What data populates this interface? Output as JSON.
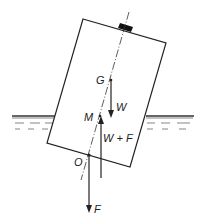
{
  "diagram": {
    "labels": {
      "G": "G",
      "W": "W",
      "M": "M",
      "WF": "W + F",
      "O": "O",
      "F": "F"
    },
    "points": {
      "G": [
        111,
        80
      ],
      "M": [
        100,
        116
      ],
      "O": [
        89,
        155
      ]
    },
    "forces": [
      {
        "name": "W",
        "from": "G",
        "direction": "down"
      },
      {
        "name": "W + F",
        "at": "M",
        "direction": "up"
      },
      {
        "name": "F",
        "from": "O",
        "direction": "down"
      }
    ],
    "colors": {
      "line": "#222222",
      "background": "#ffffff"
    }
  }
}
